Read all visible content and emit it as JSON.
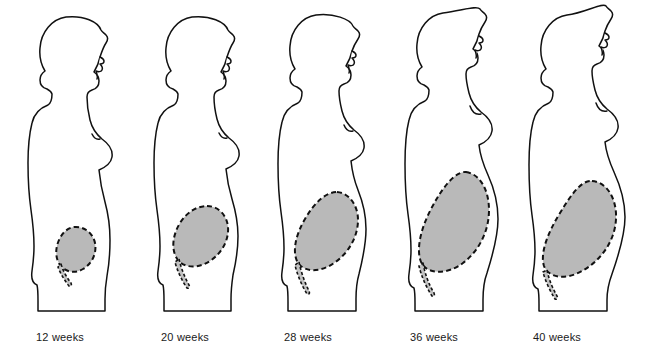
{
  "illustration": {
    "title": "Fundal height during pregnancy",
    "subject": "female-profile-silhouette",
    "background_color": "#ffffff",
    "outline_color": "#111111",
    "uterus_fill_color": "#b9b9b9",
    "uterus_outline_style": "dashed",
    "label_color": "#1a1a1a",
    "figure_count": 5
  },
  "stages": [
    {
      "label": "12 weeks",
      "weeks": 12,
      "label_x": 36,
      "figure_x": 14,
      "uterus_size": "small",
      "fundal_height_description": "just above pubic symphysis"
    },
    {
      "label": "20 weeks",
      "weeks": 20,
      "label_x": 161,
      "figure_x": 140,
      "uterus_size": "small-medium",
      "fundal_height_description": "at the level of the umbilicus"
    },
    {
      "label": "28 weeks",
      "weeks": 28,
      "label_x": 284,
      "figure_x": 264,
      "uterus_size": "medium",
      "fundal_height_description": "midway between umbilicus and xiphoid"
    },
    {
      "label": "36 weeks",
      "weeks": 36,
      "label_x": 410,
      "figure_x": 390,
      "uterus_size": "large",
      "fundal_height_description": "at the xiphoid process"
    },
    {
      "label": "40 weeks",
      "weeks": 40,
      "label_x": 533,
      "figure_x": 514,
      "uterus_size": "largest",
      "fundal_height_description": "drops slightly after lightening"
    }
  ]
}
